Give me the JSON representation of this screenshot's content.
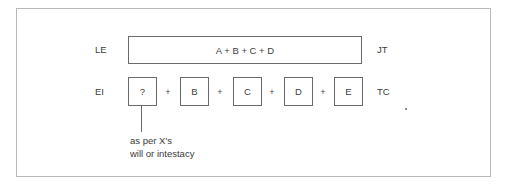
{
  "diagram": {
    "row1": {
      "left_label": "LE",
      "box_text": "A + B + C + D",
      "right_label": "JT"
    },
    "row2": {
      "left_label": "EI",
      "boxes": [
        "?",
        "B",
        "C",
        "D",
        "E"
      ],
      "operators": [
        "+",
        "+",
        "+",
        "+"
      ],
      "right_label": "TC"
    },
    "annotation": {
      "line1": "as per X's",
      "line2": "will or intestacy"
    }
  },
  "colors": {
    "frame_border": "#b9b9b9",
    "box_border": "#6a6a6a",
    "text": "#3c3c3c"
  }
}
